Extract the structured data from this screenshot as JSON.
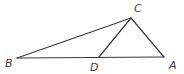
{
  "figure": {
    "type": "geometry-diagram",
    "canvas": {
      "width": 184,
      "height": 74
    },
    "background_color": "#ffffff",
    "stroke_color": "#3a3a3a",
    "stroke_width": 1.2,
    "label_color": "#3a3a3a",
    "points": [
      {
        "id": "B",
        "label": "B",
        "x": 17,
        "y": 58,
        "label_x": 5,
        "label_y": 67
      },
      {
        "id": "A",
        "label": "A",
        "x": 164,
        "y": 57,
        "label_x": 169,
        "label_y": 69
      },
      {
        "id": "C",
        "label": "C",
        "x": 131,
        "y": 18,
        "label_x": 134,
        "label_y": 12
      },
      {
        "id": "D",
        "label": "D",
        "x": 99,
        "y": 57,
        "label_x": 90,
        "label_y": 71
      }
    ],
    "segments": [
      {
        "id": "BA",
        "from": "B",
        "to": "A",
        "x1": 17,
        "y1": 58,
        "x2": 164,
        "y2": 57
      },
      {
        "id": "BC",
        "from": "B",
        "to": "C",
        "x1": 17,
        "y1": 58,
        "x2": 131,
        "y2": 18
      },
      {
        "id": "CA",
        "from": "C",
        "to": "A",
        "x1": 131,
        "y1": 18,
        "x2": 164,
        "y2": 57
      },
      {
        "id": "CD",
        "from": "C",
        "to": "D",
        "x1": 131,
        "y1": 18,
        "x2": 99,
        "y2": 57
      }
    ]
  }
}
